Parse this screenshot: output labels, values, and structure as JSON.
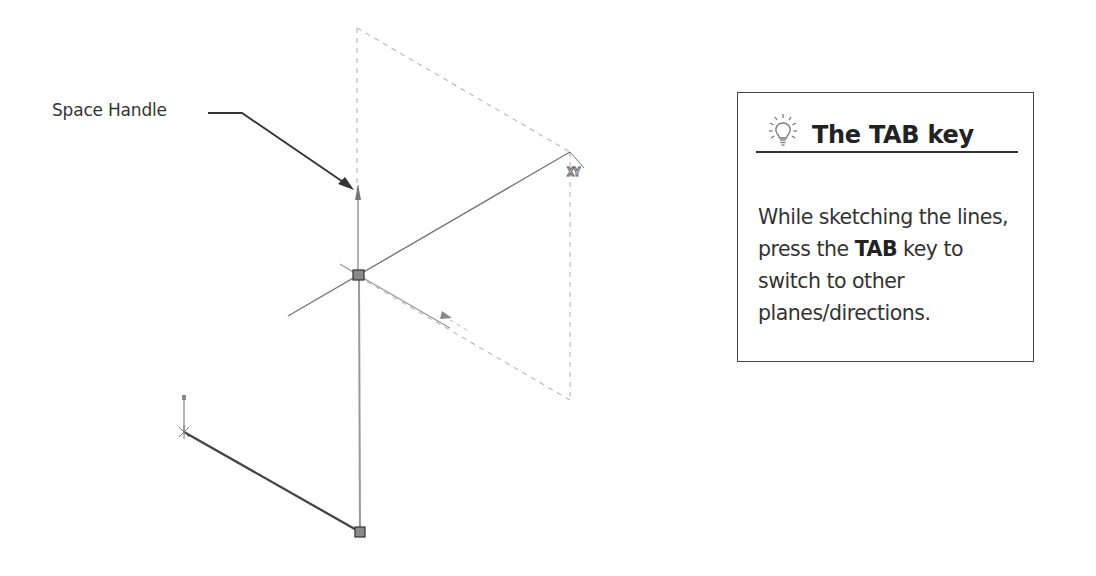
{
  "callout": {
    "label": "Space Handle"
  },
  "tip": {
    "icon": "lightbulb-icon",
    "title": "The TAB key",
    "body_parts": {
      "p1": "While sketching the lines, press the ",
      "bold": "TAB",
      "p2": " key to switch to other planes/directions."
    }
  },
  "sketch": {
    "plane_indicator": "XY",
    "colors": {
      "solid_line": "#555555",
      "construction_line": "#bbbbbb",
      "active_line": "#888888",
      "endpoint_fill": "#8a8a8a",
      "tip_border": "#444444"
    }
  }
}
